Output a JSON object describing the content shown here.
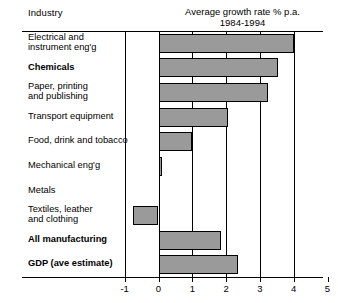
{
  "header": {
    "industry_label": "Industry",
    "title_line1": "Average growth rate % p.a.",
    "title_line2": "1984-1994"
  },
  "chart_data": {
    "type": "bar",
    "orientation": "horizontal",
    "title": "Average growth rate % p.a. 1984-1994",
    "xlabel": "",
    "ylabel": "Industry",
    "xlim": [
      -1,
      5
    ],
    "xticks": [
      "-1",
      "0",
      "1",
      "2",
      "3",
      "4",
      "5"
    ],
    "xtick_values": [
      -1,
      0,
      1,
      2,
      3,
      4,
      5
    ],
    "grid": true,
    "gridlines_at": [
      0,
      1,
      2,
      3,
      4
    ],
    "legend": "none",
    "bar_fill": "#9a9a9a",
    "bar_edge": "#000000",
    "categories": [
      "Electrical and\ninstrument eng'g",
      "Chemicals",
      "Paper, printing\nand publishing",
      "Transport equipment",
      "Food, drink and tobacco",
      "Mechanical eng'g",
      "Metals",
      "Textiles, leather\nand clothing",
      "All manufacturing",
      "GDP (ave estimate)"
    ],
    "values": [
      4.0,
      3.55,
      3.25,
      2.05,
      1.0,
      0.1,
      0.0,
      -0.75,
      1.85,
      2.35
    ],
    "bold_categories": [
      "Chemicals",
      "All manufacturing",
      "GDP (ave estimate)"
    ]
  }
}
